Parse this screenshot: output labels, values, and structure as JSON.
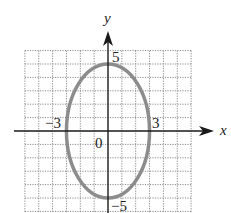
{
  "chart_data": {
    "type": "line",
    "title": "",
    "xlabel": "x",
    "ylabel": "y",
    "xlim": [
      -6,
      6
    ],
    "ylim": [
      -6,
      6
    ],
    "grid": true,
    "grid_style": "dotted",
    "tick_labels": {
      "x_neg": "−3",
      "x_pos": "3",
      "y_pos": "5",
      "y_neg": "−5",
      "origin": "0"
    },
    "series": [
      {
        "name": "ellipse",
        "shape": "ellipse",
        "center": [
          0,
          0
        ],
        "semi_axis_x": 3,
        "semi_axis_y": 5,
        "vertices": [
          [
            0,
            5
          ],
          [
            0,
            -5
          ]
        ],
        "co_vertices": [
          [
            -3,
            0
          ],
          [
            3,
            0
          ]
        ],
        "color": "#8c8c8c"
      }
    ]
  },
  "style": {
    "axis_color": "#1a1a1a",
    "grid_color": "#8a8a8a",
    "curve_color": "#8c8c8c"
  }
}
